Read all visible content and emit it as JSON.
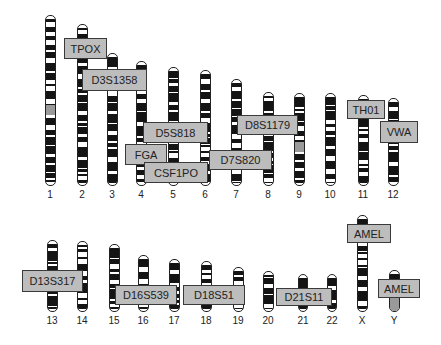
{
  "figure": {
    "title": "",
    "chromosomes": [
      {
        "id": "1",
        "x": 50,
        "top": 15,
        "bottom": 186,
        "width": 11
      },
      {
        "id": "2",
        "x": 82,
        "top": 24,
        "bottom": 186,
        "width": 11
      },
      {
        "id": "3",
        "x": 112,
        "top": 53,
        "bottom": 186,
        "width": 11
      },
      {
        "id": "4",
        "x": 141,
        "top": 61,
        "bottom": 186,
        "width": 11
      },
      {
        "id": "5",
        "x": 173,
        "top": 67,
        "bottom": 186,
        "width": 11
      },
      {
        "id": "6",
        "x": 205,
        "top": 70,
        "bottom": 186,
        "width": 11
      },
      {
        "id": "7",
        "x": 236,
        "top": 79,
        "bottom": 186,
        "width": 11
      },
      {
        "id": "8",
        "x": 268,
        "top": 92,
        "bottom": 186,
        "width": 11
      },
      {
        "id": "9",
        "x": 299,
        "top": 93,
        "bottom": 186,
        "width": 11
      },
      {
        "id": "10",
        "x": 330,
        "top": 93,
        "bottom": 186,
        "width": 11
      },
      {
        "id": "11",
        "x": 363,
        "top": 95,
        "bottom": 186,
        "width": 11
      },
      {
        "id": "12",
        "x": 393,
        "top": 98,
        "bottom": 186,
        "width": 11
      },
      {
        "id": "13",
        "x": 52,
        "top": 240,
        "bottom": 312,
        "width": 11
      },
      {
        "id": "14",
        "x": 82,
        "top": 241,
        "bottom": 312,
        "width": 11
      },
      {
        "id": "15",
        "x": 114,
        "top": 244,
        "bottom": 312,
        "width": 11
      },
      {
        "id": "16",
        "x": 143,
        "top": 255,
        "bottom": 312,
        "width": 11
      },
      {
        "id": "17",
        "x": 174,
        "top": 259,
        "bottom": 312,
        "width": 11
      },
      {
        "id": "18",
        "x": 206,
        "top": 261,
        "bottom": 312,
        "width": 11
      },
      {
        "id": "19",
        "x": 238,
        "top": 267,
        "bottom": 312,
        "width": 11
      },
      {
        "id": "20",
        "x": 268,
        "top": 271,
        "bottom": 312,
        "width": 11
      },
      {
        "id": "21",
        "x": 303,
        "top": 274,
        "bottom": 312,
        "width": 10
      },
      {
        "id": "22",
        "x": 332,
        "top": 274,
        "bottom": 312,
        "width": 10
      },
      {
        "id": "X",
        "x": 362,
        "top": 215,
        "bottom": 312,
        "width": 11
      },
      {
        "id": "Y",
        "x": 394,
        "top": 270,
        "bottom": 312,
        "width": 11
      }
    ],
    "loci": [
      {
        "name": "TPOX",
        "x": 64,
        "y": 38,
        "w": 43,
        "h": 21
      },
      {
        "name": "D3S1358",
        "x": 82,
        "y": 69,
        "w": 65,
        "h": 22
      },
      {
        "name": "D5S818",
        "x": 143,
        "y": 122,
        "w": 65,
        "h": 21
      },
      {
        "name": "FGA",
        "x": 125,
        "y": 144,
        "w": 42,
        "h": 21
      },
      {
        "name": "CSF1PO",
        "x": 144,
        "y": 162,
        "w": 64,
        "h": 21
      },
      {
        "name": "D7S820",
        "x": 209,
        "y": 150,
        "w": 63,
        "h": 20
      },
      {
        "name": "D8S1179",
        "x": 237,
        "y": 115,
        "w": 61,
        "h": 20
      },
      {
        "name": "TH01",
        "x": 347,
        "y": 100,
        "w": 38,
        "h": 19
      },
      {
        "name": "VWA",
        "x": 380,
        "y": 121,
        "w": 38,
        "h": 22
      },
      {
        "name": "D13S317",
        "x": 22,
        "y": 270,
        "w": 61,
        "h": 22
      },
      {
        "name": "D16S539",
        "x": 115,
        "y": 285,
        "w": 62,
        "h": 20
      },
      {
        "name": "D18S51",
        "x": 183,
        "y": 285,
        "w": 62,
        "h": 20
      },
      {
        "name": "D21S11",
        "x": 276,
        "y": 288,
        "w": 56,
        "h": 18
      },
      {
        "name": "AMEL",
        "x": 347,
        "y": 224,
        "w": 44,
        "h": 19
      },
      {
        "name": "AMEL",
        "x": 378,
        "y": 279,
        "w": 42,
        "h": 19
      }
    ]
  }
}
